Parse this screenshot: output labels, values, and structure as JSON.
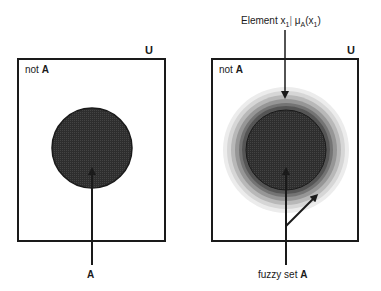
{
  "left_panel": {
    "universe_label": "U",
    "complement_label_prefix": "not ",
    "complement_label_set": "A",
    "set_label": "A",
    "set_type": "crisp"
  },
  "right_panel": {
    "universe_label": "U",
    "complement_label_prefix": "not ",
    "complement_label_set": "A",
    "set_label_prefix": "fuzzy set ",
    "set_label_set": "A",
    "set_type": "fuzzy",
    "element_label": {
      "prefix": "Element x",
      "prefix_sub": "1",
      "separator": "|",
      "mu": "μ",
      "mu_sub": "A",
      "arg_open": "(x",
      "arg_sub": "1",
      "arg_close": ")"
    }
  },
  "colors": {
    "stroke": "#1a1a1a",
    "core_fill": "#2e2e2e",
    "ring_1": "#555555",
    "ring_2": "#7a7a7a",
    "ring_3": "#a0a0a0",
    "ring_4": "#c6c6c6",
    "ring_5": "#e2e2e2",
    "background": "#ffffff"
  }
}
